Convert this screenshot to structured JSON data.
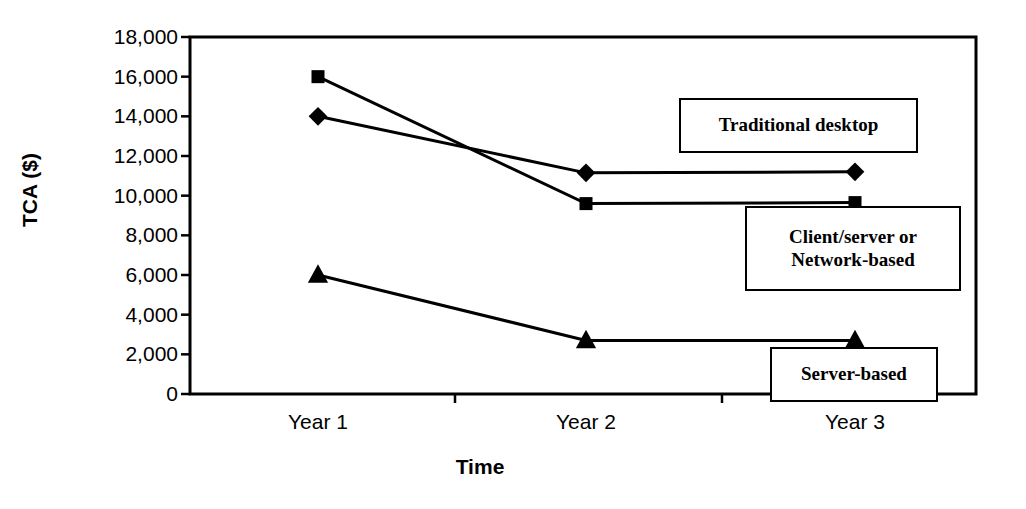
{
  "chart_data": {
    "type": "line",
    "title": "",
    "xlabel": "Time",
    "ylabel": "TCA ($)",
    "categories": [
      "Year 1",
      "Year 2",
      "Year 3"
    ],
    "ylim": [
      0,
      18000
    ],
    "yticks": [
      "0",
      "2,000",
      "4,000",
      "6,000",
      "8,000",
      "10,000",
      "12,000",
      "14,000",
      "16,000",
      "18,000"
    ],
    "ytick_values": [
      0,
      2000,
      4000,
      6000,
      8000,
      10000,
      12000,
      14000,
      16000,
      18000
    ],
    "grid": false,
    "legend_position": "inline-callouts",
    "series": [
      {
        "name": "Traditional desktop",
        "marker": "square",
        "values": [
          16000,
          9600,
          9650
        ]
      },
      {
        "name": "Client/server or Network-based",
        "marker": "diamond",
        "values": [
          14000,
          11150,
          11200
        ]
      },
      {
        "name": "Server-based",
        "marker": "triangle",
        "values": [
          6000,
          2700,
          2700
        ]
      }
    ],
    "annotations": [
      {
        "id": "traditional-desktop",
        "lines": [
          "Traditional desktop"
        ]
      },
      {
        "id": "client-server-network-based",
        "lines": [
          "Client/server or",
          "Network-based"
        ]
      },
      {
        "id": "server-based",
        "lines": [
          "Server-based"
        ]
      }
    ],
    "colors": {
      "line": "#000000",
      "marker": "#000000",
      "axis": "#000000",
      "background": "#ffffff"
    }
  }
}
